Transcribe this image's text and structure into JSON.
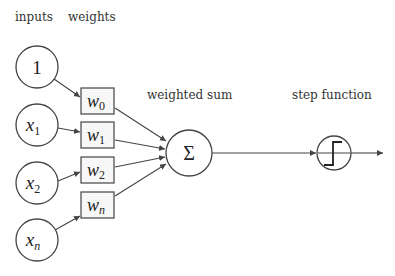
{
  "labels": {
    "inputs": "inputs",
    "weights": "weights",
    "weighted_sum": "weighted sum",
    "step_function": "step function"
  },
  "inputs": [
    {
      "base": "1",
      "sub": ""
    },
    {
      "base": "x",
      "sub": "1"
    },
    {
      "base": "x",
      "sub": "2"
    },
    {
      "base": "x",
      "sub": "n"
    }
  ],
  "weights": [
    {
      "base": "w",
      "sub": "0"
    },
    {
      "base": "w",
      "sub": "1"
    },
    {
      "base": "w",
      "sub": "2"
    },
    {
      "base": "w",
      "sub": "n"
    }
  ],
  "sum_node": {
    "symbol": "Σ"
  },
  "step_node": {
    "icon": "step-function-icon"
  }
}
